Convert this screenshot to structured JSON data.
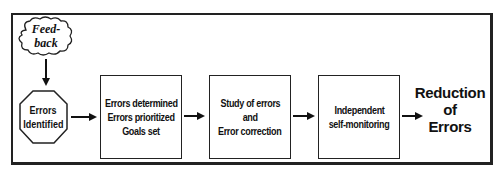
{
  "diagram": {
    "type": "flowchart",
    "start": {
      "shape": "cloud",
      "lines": [
        "Feed-",
        "back"
      ]
    },
    "nodes": [
      {
        "id": "errors-identified",
        "shape": "octagon",
        "lines": [
          "Errors",
          "Identified"
        ]
      },
      {
        "id": "errors-determined",
        "shape": "rectangle",
        "lines": [
          "Errors determined",
          "Errors prioritized",
          "Goals set"
        ]
      },
      {
        "id": "study-of-errors",
        "shape": "rectangle",
        "lines": [
          "Study of errors",
          "and",
          "Error correction"
        ]
      },
      {
        "id": "self-monitoring",
        "shape": "rectangle",
        "lines": [
          "Independent",
          "self-monitoring"
        ]
      }
    ],
    "outcome": {
      "lines": [
        "Reduction",
        "of",
        "Errors"
      ]
    },
    "edges": [
      {
        "from": "feedback",
        "to": "errors-identified",
        "direction": "down"
      },
      {
        "from": "errors-identified",
        "to": "errors-determined",
        "direction": "right"
      },
      {
        "from": "errors-determined",
        "to": "study-of-errors",
        "direction": "right"
      },
      {
        "from": "study-of-errors",
        "to": "self-monitoring",
        "direction": "right"
      },
      {
        "from": "self-monitoring",
        "to": "reduction-of-errors",
        "direction": "right"
      }
    ],
    "colors": {
      "stroke": "#222222",
      "background": "#ffffff",
      "text": "#111111"
    }
  }
}
